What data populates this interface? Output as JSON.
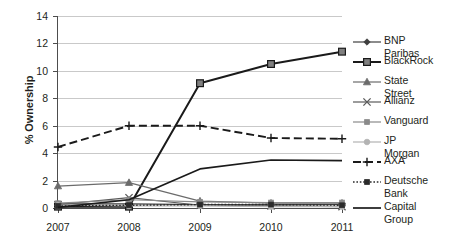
{
  "chart_data": {
    "type": "line",
    "title": "",
    "xlabel": "",
    "ylabel": "% Ownership",
    "categories": [
      "2007",
      "2008",
      "2009",
      "2010",
      "2011"
    ],
    "ylim": [
      0,
      14
    ],
    "yticks": [
      0,
      2,
      4,
      6,
      8,
      10,
      12,
      14
    ],
    "grid": "horizontal",
    "legend_position": "right",
    "series": [
      {
        "name": "BNP Paribas",
        "values": [
          0.3,
          0.3,
          0.25,
          0.25,
          0.25
        ],
        "marker": "diamond",
        "line": "solid",
        "color": "#3f3f3f"
      },
      {
        "name": "BlackRock",
        "values": [
          0.1,
          0.1,
          9.1,
          10.5,
          11.4
        ],
        "marker": "square",
        "line": "solid",
        "color": "#1a1a1a"
      },
      {
        "name": "State Street",
        "values": [
          1.6,
          1.85,
          0.5,
          0.35,
          0.35
        ],
        "marker": "triangle",
        "line": "solid",
        "color": "#6b6b6b"
      },
      {
        "name": "Allianz",
        "values": [
          0.25,
          0.75,
          0.2,
          0.15,
          0.1
        ],
        "marker": "x",
        "line": "solid",
        "color": "#5a5a5a"
      },
      {
        "name": "Vanguard",
        "values": [
          0.35,
          0.6,
          0.45,
          0.4,
          0.4
        ],
        "marker": "small-square",
        "line": "solid",
        "color": "#8a8a8a"
      },
      {
        "name": "JP Morgan",
        "values": [
          0.2,
          0.15,
          0.15,
          0.1,
          0.1
        ],
        "marker": "circle",
        "line": "solid",
        "color": "#b3b3b3"
      },
      {
        "name": "AXA",
        "values": [
          4.45,
          6.0,
          6.0,
          5.1,
          5.05
        ],
        "marker": "plus",
        "line": "dashed",
        "color": "#1a1a1a"
      },
      {
        "name": "Deutsche\nBank",
        "values": [
          0.15,
          0.2,
          0.25,
          0.25,
          0.2
        ],
        "marker": "small-square",
        "line": "dotted",
        "color": "#2b2b2b"
      },
      {
        "name": "Capital Group",
        "values": [
          0.05,
          0.6,
          2.85,
          3.5,
          3.45
        ],
        "marker": "none",
        "line": "solid",
        "color": "#1a1a1a"
      }
    ]
  }
}
